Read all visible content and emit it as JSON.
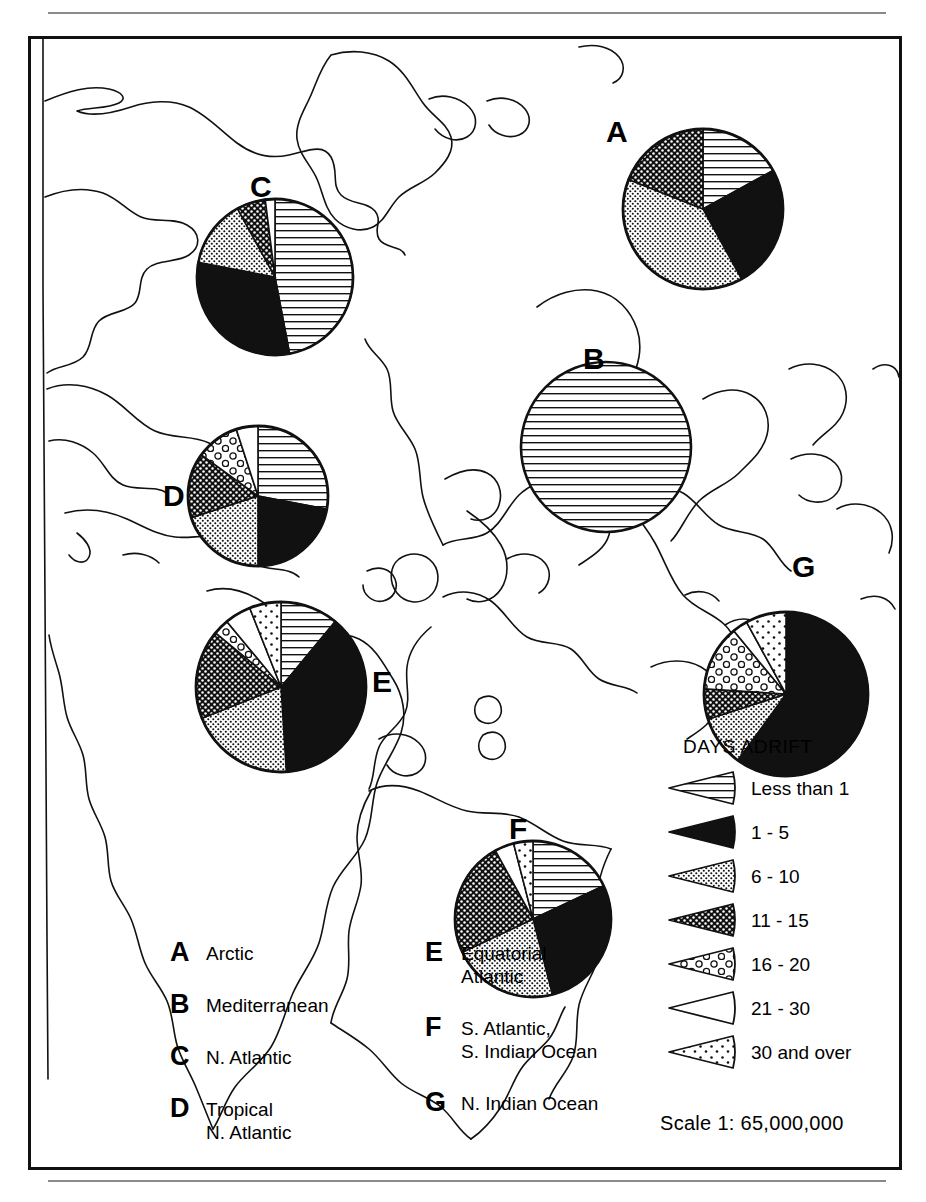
{
  "figure": {
    "title": "Days Adrift",
    "scale_text": "Scale  1: 65,000,000"
  },
  "legend": {
    "title": "DAYS ADRIFT",
    "entries": [
      {
        "key": "lt1",
        "label": "Less than 1",
        "pattern": "horizontal-lines"
      },
      {
        "key": "1-5",
        "label": "1 - 5",
        "pattern": "solid-black"
      },
      {
        "key": "6-10",
        "label": "6 - 10",
        "pattern": "fine-dots"
      },
      {
        "key": "11-15",
        "label": "11 - 15",
        "pattern": "crosshatch-dots"
      },
      {
        "key": "16-20",
        "label": "16 - 20",
        "pattern": "open-circles"
      },
      {
        "key": "21-30",
        "label": "21 - 30",
        "pattern": "white-blank"
      },
      {
        "key": "30+",
        "label": "30 and over",
        "pattern": "sparse-dots"
      }
    ]
  },
  "region_keys": {
    "left": [
      {
        "letter": "A",
        "name": "Arctic"
      },
      {
        "letter": "B",
        "name": "Mediterranean"
      },
      {
        "letter": "C",
        "name": "N. Atlantic"
      },
      {
        "letter": "D",
        "name": "Tropical\nN. Atlantic"
      }
    ],
    "right": [
      {
        "letter": "E",
        "name": "Equatorial\nAtlantic"
      },
      {
        "letter": "F",
        "name": "S. Atlantic,\nS. Indian Ocean"
      },
      {
        "letter": "G",
        "name": "N. Indian Ocean"
      }
    ]
  },
  "chart_data": {
    "type": "pie",
    "title": "Days Adrift",
    "legend_position": "right-bottom",
    "categories": [
      "Less than 1",
      "1 - 5",
      "6 - 10",
      "11 - 15",
      "16 - 20",
      "21 - 30",
      "30 and over"
    ],
    "patterns": [
      "horizontal-lines",
      "solid-black",
      "fine-dots",
      "crosshatch-dots",
      "open-circles",
      "white-blank",
      "sparse-dots"
    ],
    "unit": "percent",
    "pies": [
      {
        "id": "A",
        "name": "Arctic",
        "cx": 672,
        "cy": 170,
        "r": 80,
        "label_x": 575,
        "label_y": 78,
        "values": [
          17,
          25,
          39,
          19,
          0,
          0,
          0
        ]
      },
      {
        "id": "B",
        "name": "Mediterranean",
        "cx": 575,
        "cy": 408,
        "r": 85,
        "label_x": 552,
        "label_y": 305,
        "values": [
          100,
          0,
          0,
          0,
          0,
          0,
          0
        ]
      },
      {
        "id": "C",
        "name": "N. Atlantic",
        "cx": 244,
        "cy": 238,
        "r": 78,
        "label_x": 219,
        "label_y": 133,
        "values": [
          47,
          31,
          14,
          6,
          0,
          2,
          0
        ]
      },
      {
        "id": "D",
        "name": "Tropical N. Atlantic",
        "cx": 227,
        "cy": 457,
        "r": 70,
        "label_x": 132,
        "label_y": 442,
        "values": [
          28,
          22,
          20,
          15,
          10,
          5,
          0
        ]
      },
      {
        "id": "E",
        "name": "Equatorial Atlantic",
        "cx": 250,
        "cy": 648,
        "r": 85,
        "label_x": 341,
        "label_y": 628,
        "values": [
          11,
          38,
          20,
          17,
          3,
          5,
          6
        ]
      },
      {
        "id": "F",
        "name": "S. Atlantic, S. Indian Ocean",
        "cx": 502,
        "cy": 880,
        "r": 78,
        "label_x": 478,
        "label_y": 775,
        "values": [
          18,
          28,
          22,
          24,
          0,
          4,
          4
        ]
      },
      {
        "id": "G",
        "name": "N. Indian Ocean",
        "cx": 755,
        "cy": 655,
        "r": 82,
        "label_x": 761,
        "label_y": 513,
        "values": [
          0,
          60,
          10,
          6,
          13,
          3,
          8
        ]
      }
    ]
  }
}
